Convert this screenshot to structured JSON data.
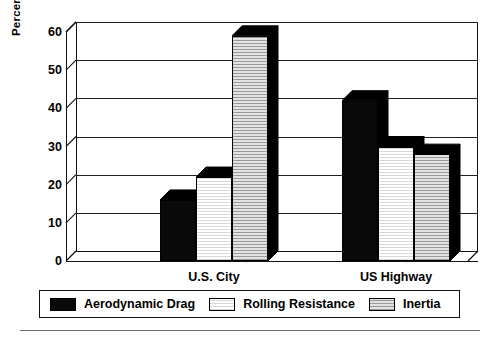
{
  "chart_data": {
    "type": "bar",
    "title": "",
    "subtitle": "",
    "xlabel": "",
    "ylabel": "Percentage of Total Work",
    "categories": [
      "U.S. City",
      "US Highway"
    ],
    "series": [
      {
        "name": "Aerodynamic Drag",
        "values": [
          16,
          42
        ],
        "color": "#0a0a0a",
        "fill": "solid-black"
      },
      {
        "name": "Rolling Resistance",
        "values": [
          22,
          30
        ],
        "color": "#fbfbfb",
        "fill": "fine-white-grid"
      },
      {
        "name": "Inertia",
        "values": [
          59,
          28
        ],
        "color": "#cfcfcf",
        "fill": "gray-grid"
      }
    ],
    "ylim": [
      0,
      60
    ],
    "yticks": [
      0,
      10,
      20,
      30,
      40,
      50,
      60
    ],
    "ytick_labels": [
      "0",
      "10",
      "20",
      "30",
      "40",
      "50",
      "60"
    ],
    "grid": true,
    "grid_axis": "y",
    "legend_position": "bottom",
    "style": "3d-bar",
    "axis_break_marks": 2,
    "background": "#ffffff",
    "frame_color": "#111111"
  },
  "axis": {
    "y_title": "Percentage of Total Work"
  },
  "legend": {
    "items": [
      {
        "label": "Aerodynamic Drag",
        "swatch": "black"
      },
      {
        "label": "Rolling Resistance",
        "swatch": "white"
      },
      {
        "label": "Inertia",
        "swatch": "gray"
      }
    ]
  }
}
